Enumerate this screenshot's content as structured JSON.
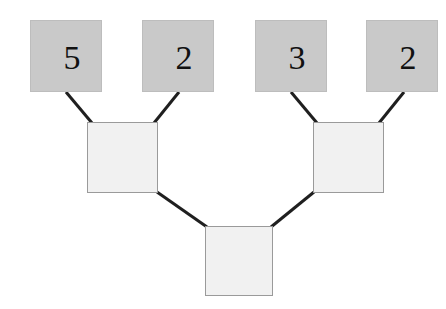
{
  "diagram": {
    "type": "hierarchical-tree",
    "title": "",
    "background_color": "#ffffff",
    "colors": {
      "leaf_fill": "#c9c9c9",
      "leaf_border": "#bdbdbd",
      "internal_fill": "#f1f1f1",
      "internal_border": "#9a9a9a",
      "edge_color": "#1f1f1f",
      "label_color": "#111111"
    },
    "edge_width": 3,
    "nodes": [
      {
        "id": "leaf1",
        "kind": "leaf",
        "label": "5",
        "x": 30,
        "y": 20,
        "w": 72,
        "h": 72
      },
      {
        "id": "leaf2",
        "kind": "leaf",
        "label": "2",
        "x": 142,
        "y": 20,
        "w": 72,
        "h": 72
      },
      {
        "id": "leaf3",
        "kind": "leaf",
        "label": "3",
        "x": 255,
        "y": 20,
        "w": 72,
        "h": 72
      },
      {
        "id": "leaf4",
        "kind": "leaf",
        "label": "2",
        "x": 366,
        "y": 20,
        "w": 72,
        "h": 72
      },
      {
        "id": "internalLeft",
        "kind": "internal",
        "label": "",
        "x": 87,
        "y": 122,
        "w": 71,
        "h": 71
      },
      {
        "id": "internalRight",
        "kind": "internal",
        "label": "",
        "x": 313,
        "y": 122,
        "w": 71,
        "h": 71
      },
      {
        "id": "root",
        "kind": "internal",
        "label": "",
        "x": 205,
        "y": 226,
        "w": 68,
        "h": 70
      }
    ],
    "edges": [
      {
        "from": "leaf1",
        "to": "internalLeft",
        "x1": 66,
        "y1": 92,
        "x2": 92,
        "y2": 123
      },
      {
        "from": "leaf2",
        "to": "internalLeft",
        "x1": 179,
        "y1": 92,
        "x2": 154,
        "y2": 123
      },
      {
        "from": "leaf3",
        "to": "internalRight",
        "x1": 291,
        "y1": 92,
        "x2": 317,
        "y2": 123
      },
      {
        "from": "leaf4",
        "to": "internalRight",
        "x1": 404,
        "y1": 92,
        "x2": 379,
        "y2": 123
      },
      {
        "from": "internalLeft",
        "to": "root",
        "x1": 157,
        "y1": 192,
        "x2": 207,
        "y2": 227
      },
      {
        "from": "internalRight",
        "to": "root",
        "x1": 314,
        "y1": 192,
        "x2": 271,
        "y2": 227
      }
    ]
  }
}
